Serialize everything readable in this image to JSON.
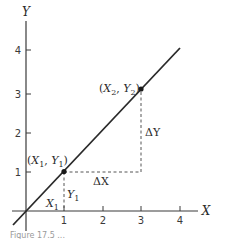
{
  "figure": {
    "axes": {
      "x_label": "X",
      "y_label": "Y",
      "x_ticks": [
        "1",
        "2",
        "3",
        "4"
      ],
      "y_ticks": [
        "1",
        "2",
        "3",
        "4"
      ],
      "origin_px": [
        26,
        211
      ],
      "unit_px": 38.5
    },
    "line": {
      "description": "straight line through origin with slope 1",
      "color": "#2a2a2a"
    },
    "points": [
      {
        "label_open": "(",
        "x_sym": "X",
        "x_sub": "1",
        "sep": ", ",
        "y_sym": "Y",
        "y_sub": "1",
        "label_close": ")",
        "x": 1,
        "y": 1
      },
      {
        "label_open": "(",
        "x_sym": "X",
        "x_sub": "2",
        "sep": ", ",
        "y_sym": "Y",
        "y_sub": "2",
        "label_close": ")",
        "x": 3,
        "y": 3
      }
    ],
    "annotations": {
      "delta_x": "ΔX",
      "delta_y": "ΔY",
      "x1_label": {
        "sym": "X",
        "sub": "1"
      },
      "y1_label": {
        "sym": "Y",
        "sub": "1"
      }
    },
    "caption": "Figure 17.5 ..."
  }
}
